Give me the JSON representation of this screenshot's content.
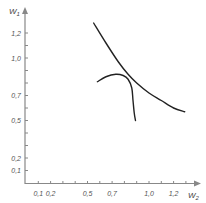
{
  "chart_data": {
    "type": "line",
    "title": "",
    "xlabel": "W2",
    "ylabel": "W1",
    "xlim": [
      0,
      1.4
    ],
    "ylim": [
      0,
      1.4
    ],
    "grid": false,
    "legend": null,
    "x_ticks": [
      0.1,
      0.2,
      0.5,
      0.7,
      1.0,
      1.2
    ],
    "x_tick_labels": [
      "0,1",
      "0,2",
      "0,5",
      "0,7",
      "1,0",
      "1,2"
    ],
    "x_minor_ticks": [
      0.1,
      0.2,
      0.3,
      0.4,
      0.5,
      0.6,
      0.7,
      0.8,
      0.9,
      1.0,
      1.1,
      1.2,
      1.3
    ],
    "y_ticks": [
      0.1,
      0.2,
      0.5,
      0.7,
      1.0,
      1.2
    ],
    "y_tick_labels": [
      "0,1",
      "0,2",
      "0,5",
      "0,7",
      "1,0",
      "1,2"
    ],
    "y_minor_ticks": [
      0.1,
      0.2,
      0.3,
      0.4,
      0.5,
      0.6,
      0.7,
      0.8,
      0.9,
      1.0,
      1.1,
      1.2
    ],
    "series": [
      {
        "name": "curve-1",
        "x": [
          0.55,
          0.65,
          0.75,
          0.83,
          0.9,
          1.0,
          1.1,
          1.2,
          1.29
        ],
        "y": [
          1.28,
          1.12,
          0.97,
          0.87,
          0.8,
          0.72,
          0.66,
          0.6,
          0.57
        ]
      },
      {
        "name": "curve-2",
        "x": [
          0.58,
          0.65,
          0.73,
          0.79,
          0.83,
          0.86,
          0.87,
          0.88,
          0.89
        ],
        "y": [
          0.81,
          0.85,
          0.87,
          0.86,
          0.83,
          0.76,
          0.66,
          0.56,
          0.5
        ]
      }
    ]
  }
}
